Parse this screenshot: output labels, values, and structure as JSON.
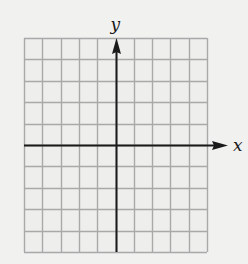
{
  "diagram": {
    "type": "coordinate-grid",
    "columns": 10,
    "rows": 10,
    "origin_column": 5,
    "origin_row": 5,
    "x_axis_label": "x",
    "y_axis_label": "y",
    "colors": {
      "background": "#f1f1f0",
      "grid_fill": "#eeeeed",
      "grid_line": "#a9a9a9",
      "axis": "#1a1a1a"
    }
  }
}
